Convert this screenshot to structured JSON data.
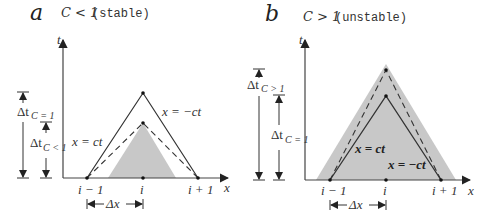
{
  "panels": [
    {
      "letter": "a",
      "condition": "C < 1",
      "status": "(stable)",
      "axis_t": "t",
      "axis_x": "x",
      "ticks": [
        "i − 1",
        "i",
        "i + 1"
      ],
      "dx_label": "Δx",
      "line_left": "x = ct",
      "line_right": "x = −ct",
      "dt_outer": {
        "main": "Δt",
        "sub": "C = 1"
      },
      "dt_inner": {
        "main": "Δt",
        "sub": "C < 1"
      }
    },
    {
      "letter": "b",
      "condition": "C > 1",
      "status": "(unstable)",
      "axis_t": "t",
      "axis_x": "x",
      "ticks": [
        "i − 1",
        "i",
        "i + 1"
      ],
      "dx_label": "Δx",
      "line_left": "x = ct",
      "line_right": "x = −ct",
      "dt_outer": {
        "main": "Δt",
        "sub": "C > 1"
      },
      "dt_inner": {
        "main": "Δt",
        "sub": "C = 1"
      }
    }
  ],
  "colors": {
    "shade": "#c8c8c8",
    "line": "#333333"
  }
}
